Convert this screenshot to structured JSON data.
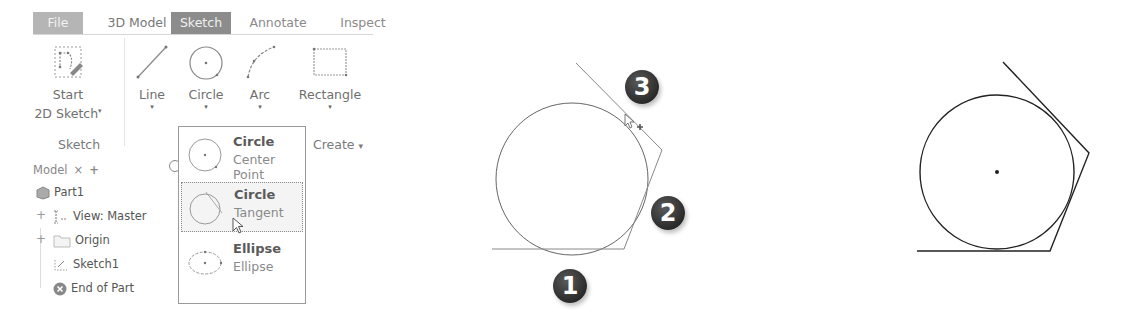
{
  "ribbon": {
    "tabs": [
      {
        "label": "File",
        "active": false
      },
      {
        "label": "3D Model",
        "active": false
      },
      {
        "label": "Sketch",
        "active": true
      },
      {
        "label": "Annotate",
        "active": false
      },
      {
        "label": "Inspect",
        "active": false
      }
    ],
    "tools": [
      {
        "label_line1": "Start",
        "label_line2": "2D Sketch",
        "icon": "start-2d-sketch-icon",
        "has_dropdown": true
      },
      {
        "label_line1": "Line",
        "icon": "line-icon",
        "has_dropdown": true
      },
      {
        "label_line1": "Circle",
        "icon": "circle-icon",
        "has_dropdown": true
      },
      {
        "label_line1": "Arc",
        "icon": "arc-icon",
        "has_dropdown": true
      },
      {
        "label_line1": "Rectangle",
        "icon": "rectangle-icon",
        "has_dropdown": true
      }
    ],
    "groups": {
      "sketch": "Sketch",
      "create": "Create",
      "create_arrow": "▾"
    },
    "dropdown_arrow": "▾"
  },
  "browser": {
    "tab_label": "Model",
    "close_glyph": "×",
    "add_glyph": "+",
    "items": [
      {
        "label": "Part1",
        "icon": "part-icon",
        "expander": ""
      },
      {
        "label": "View: Master",
        "icon": "view-icon",
        "expander": "+"
      },
      {
        "label": "Origin",
        "icon": "folder-icon",
        "expander": "+"
      },
      {
        "label": "Sketch1",
        "icon": "sketch-icon",
        "expander": ""
      },
      {
        "label": "End of Part",
        "icon": "end-of-part-icon",
        "expander": ""
      }
    ]
  },
  "circle_dropdown": {
    "items": [
      {
        "title": "Circle",
        "subtitle": "Center Point",
        "icon": "circle-center-point-icon",
        "hover": false
      },
      {
        "title": "Circle",
        "subtitle": "Tangent",
        "icon": "circle-tangent-icon",
        "hover": true
      },
      {
        "title": "Ellipse",
        "subtitle": "Ellipse",
        "icon": "ellipse-icon",
        "hover": false
      }
    ]
  },
  "steps": {
    "badges": [
      "1",
      "2",
      "3"
    ]
  },
  "colors": {
    "tab_active": "#8c8c8c",
    "tab_file": "#b5b5b5",
    "badge": "#333333",
    "line_gray": "#777777",
    "line_black": "#222222"
  }
}
